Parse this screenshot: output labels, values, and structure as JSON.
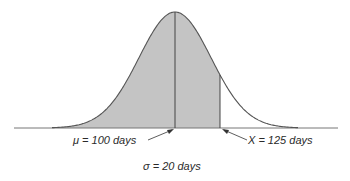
{
  "chart_data": {
    "type": "area",
    "title": "",
    "distribution": "normal",
    "mean": 100,
    "std_dev": 20,
    "unit": "days",
    "marked_value": 125,
    "shaded_region": {
      "from": "left tail",
      "to": 125
    },
    "annotations": [
      {
        "text": "μ = 100 days",
        "points_to": 100
      },
      {
        "text": "X = 125 days",
        "points_to": 125
      },
      {
        "text": "σ = 20 days"
      }
    ],
    "axes": {
      "x_ticks": false,
      "y_axis": false,
      "grid": false
    },
    "legend": null
  },
  "labels": {
    "mu": "μ = 100 days",
    "x": "X = 125 days",
    "sigma": "σ = 20 days"
  },
  "colors": {
    "shade": "#c4c4c4",
    "line": "#555555",
    "baseline": "#777777"
  },
  "geometry": {
    "baseline_y": 128,
    "peak_y": 12,
    "mean_px": 175,
    "px_per_day": 1.8,
    "curve_left_px": 52,
    "curve_right_px": 298,
    "axis_left_px": 14,
    "axis_right_px": 338
  }
}
